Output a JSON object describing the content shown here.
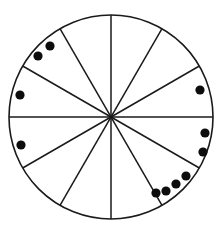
{
  "figure": {
    "title": "",
    "background_color": "#ffffff",
    "width": 224,
    "height": 232
  },
  "chart_data": {
    "type": "pie",
    "title": "",
    "subtitle": "",
    "xlabel": "",
    "ylabel": "",
    "grid": false,
    "legend_position": "none",
    "categories": [
      "1",
      "2",
      "3",
      "4",
      "5",
      "6",
      "7",
      "8",
      "9",
      "10",
      "11",
      "12"
    ],
    "values": [
      1,
      1,
      1,
      1,
      1,
      1,
      1,
      1,
      1,
      1,
      1,
      1
    ],
    "slice_count": 12,
    "slice_angle_degrees": 30,
    "annotations": {
      "dot_count": 11
    }
  },
  "circle": {
    "center_x": 111,
    "center_y": 117,
    "radius": 102,
    "stroke_color": "#1a1a1a",
    "stroke_width": 1.6,
    "fill_color": "#ffffff"
  },
  "spokes": {
    "stroke_color": "#1a1a1a",
    "stroke_width": 1.5,
    "count": 6,
    "angles_degrees": [
      0,
      30,
      60,
      90,
      120,
      150
    ]
  },
  "dots": {
    "fill_color": "#0d0d0d",
    "radius": 4.6,
    "count": 11,
    "points": [
      {
        "label": "dot-1",
        "x": 50,
        "y": 46
      },
      {
        "label": "dot-2",
        "x": 38,
        "y": 56
      },
      {
        "label": "dot-3",
        "x": 20,
        "y": 95
      },
      {
        "label": "dot-4",
        "x": 21,
        "y": 145
      },
      {
        "label": "dot-5",
        "x": 200,
        "y": 90
      },
      {
        "label": "dot-6",
        "x": 205,
        "y": 133
      },
      {
        "label": "dot-7",
        "x": 203,
        "y": 152
      },
      {
        "label": "dot-8",
        "x": 186,
        "y": 176
      },
      {
        "label": "dot-9",
        "x": 176,
        "y": 184
      },
      {
        "label": "dot-10",
        "x": 166,
        "y": 191
      },
      {
        "label": "dot-11",
        "x": 156,
        "y": 193
      }
    ]
  }
}
